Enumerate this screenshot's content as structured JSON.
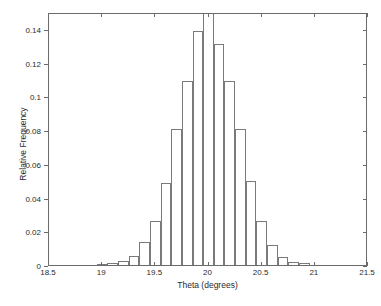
{
  "chart_data": {
    "type": "bar",
    "title": "",
    "xlabel": "Theta (degrees)",
    "ylabel": "Relative Frequency",
    "xlim": [
      18.5,
      21.5
    ],
    "ylim": [
      0,
      0.15
    ],
    "grid": false,
    "legend": null,
    "bin_width": 0.1,
    "xticks": [
      "18.5",
      "19",
      "19.5",
      "20",
      "20.5",
      "21",
      "21.5"
    ],
    "xtick_values": [
      18.5,
      19,
      19.5,
      20,
      20.5,
      21,
      21.5
    ],
    "yticks": [
      "0",
      "0.02",
      "0.04",
      "0.06",
      "0.08",
      "0.1",
      "0.12",
      "0.14"
    ],
    "ytick_values": [
      0,
      0.02,
      0.04,
      0.06,
      0.08,
      0.1,
      0.12,
      0.14
    ],
    "categories": [
      "19.0",
      "19.1",
      "19.2",
      "19.3",
      "19.4",
      "19.5",
      "19.6",
      "19.7",
      "19.8",
      "19.9",
      "20.0",
      "20.1",
      "20.2",
      "20.3",
      "20.4",
      "20.5",
      "20.6",
      "20.7",
      "20.8",
      "20.9"
    ],
    "x": [
      19.0,
      19.1,
      19.2,
      19.3,
      19.4,
      19.5,
      19.6,
      19.7,
      19.8,
      19.9,
      20.0,
      20.1,
      20.2,
      20.3,
      20.4,
      20.5,
      20.6,
      20.7,
      20.8,
      20.9
    ],
    "values": [
      0.0005,
      0.001,
      0.0025,
      0.0055,
      0.0135,
      0.026,
      0.0485,
      0.0805,
      0.109,
      0.139,
      0.152,
      0.131,
      0.109,
      0.0805,
      0.05,
      0.026,
      0.012,
      0.005,
      0.002,
      0.001
    ],
    "clipped_bars": [
      10
    ],
    "colors": {
      "bar_edge": "#7a7a7a",
      "bar_fill": "none",
      "axis": "#6b6b6b",
      "text": "#2b2b2b",
      "background": "#ffffff"
    }
  }
}
